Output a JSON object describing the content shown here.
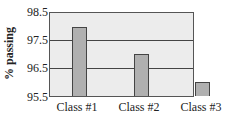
{
  "chart_data": {
    "type": "bar",
    "title": "",
    "xlabel": "",
    "ylabel": "% passing",
    "categories": [
      "Class #1",
      "Class #2",
      "Class #3"
    ],
    "values": [
      98.0,
      97.0,
      96.0
    ],
    "ylim": [
      95.5,
      98.5
    ],
    "yticks": [
      "98.5",
      "97.5",
      "96.5",
      "95.5"
    ],
    "grid": true,
    "legend": null,
    "bar_color": "#b0b0b0",
    "plot_background": "#ececec"
  }
}
